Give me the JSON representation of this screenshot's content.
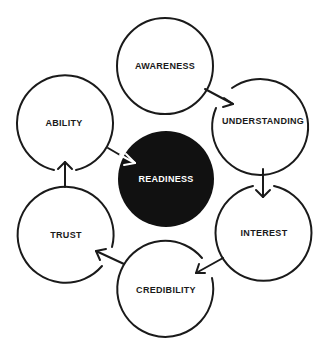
{
  "diagram": {
    "type": "cycle",
    "center": {
      "label": "READINESS",
      "fill": "#111111",
      "text_color": "#ffffff"
    },
    "nodes": [
      {
        "label": "AWARENESS"
      },
      {
        "label": "UNDERSTANDING"
      },
      {
        "label": "INTEREST"
      },
      {
        "label": "CREDIBILITY"
      },
      {
        "label": "TRUST"
      },
      {
        "label": "ABILITY"
      }
    ],
    "edges": [
      {
        "from": "AWARENESS",
        "to": "UNDERSTANDING"
      },
      {
        "from": "UNDERSTANDING",
        "to": "INTEREST"
      },
      {
        "from": "INTEREST",
        "to": "CREDIBILITY"
      },
      {
        "from": "CREDIBILITY",
        "to": "TRUST"
      },
      {
        "from": "TRUST",
        "to": "ABILITY"
      },
      {
        "from": "ABILITY",
        "to": "READINESS"
      }
    ],
    "stroke_color": "#1a1a1a",
    "background": "#ffffff"
  }
}
